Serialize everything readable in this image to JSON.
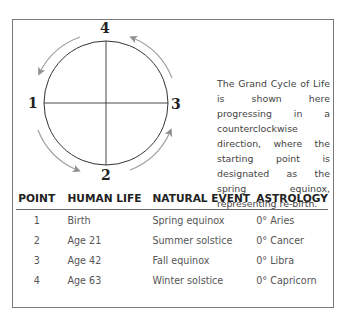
{
  "diagram": {
    "title": "Grand Cycle of Life",
    "points": [
      {
        "label": "4",
        "position": "top"
      },
      {
        "label": "1",
        "position": "left"
      },
      {
        "label": "3",
        "position": "right"
      },
      {
        "label": "2",
        "position": "bottom"
      }
    ],
    "direction": "counterclockwise",
    "arrow_color": "#9a9a9a",
    "circle_color": "#333333"
  },
  "description": "The Grand Cycle of Life is shown here progressing in a counterclockwise direction, where the starting point is designated as the spring equinox, representing re-birth.",
  "table": {
    "headers": [
      "POINT",
      "HUMAN LIFE",
      "NATURAL EVENT",
      "ASTROLOGY"
    ],
    "rows": [
      [
        "1",
        "Birth",
        "Spring equinox",
        "0° Aries"
      ],
      [
        "2",
        "Age 21",
        "Summer solstice",
        "0° Cancer"
      ],
      [
        "3",
        "Age 42",
        "Fall equinox",
        "0° Libra"
      ],
      [
        "4",
        "Age 63",
        "Winter solstice",
        "0° Capricorn"
      ]
    ]
  }
}
